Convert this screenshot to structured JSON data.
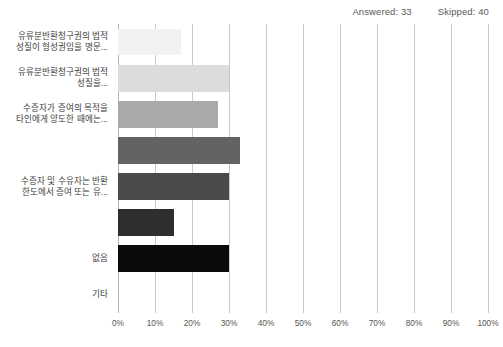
{
  "header": {
    "answered_label": "Answered: 33",
    "skipped_label": "Skipped: 40"
  },
  "chart_data": {
    "type": "bar",
    "orientation": "horizontal",
    "title": "",
    "xlabel": "",
    "ylabel": "",
    "xlim": [
      0,
      100
    ],
    "xtick_labels": [
      "0%",
      "10%",
      "20%",
      "30%",
      "40%",
      "50%",
      "60%",
      "70%",
      "80%",
      "90%",
      "100%"
    ],
    "xticks": [
      0,
      10,
      20,
      30,
      40,
      50,
      60,
      70,
      80,
      90,
      100
    ],
    "grid": true,
    "legend": "none",
    "categories": [
      "유류분반환청구권의 법적 성질이 형성권임을 명문...",
      "유류분반환청구권의 법적 성질을...",
      "수증자가 증여의 목적을 타인에게 양도한 때에는...",
      "",
      "수증자 및 수유자는 반환 한도에서 증여 또는 유...",
      "",
      "없음",
      "기타"
    ],
    "values": [
      17,
      30,
      27,
      33,
      30,
      15,
      30,
      0
    ],
    "bar_colors": [
      "#f2f2f2",
      "#dcdcdc",
      "#aaaaaa",
      "#636363",
      "#4a4a4a",
      "#2e2e2e",
      "#0a0a0a",
      "#000000"
    ]
  }
}
